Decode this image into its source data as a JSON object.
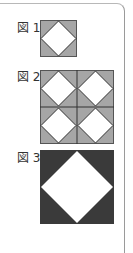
{
  "figures": [
    {
      "label": "図 1",
      "description": "Gray square with inscribed white diamond (vertices at edge midpoints)",
      "grid": "1x1",
      "fill_color": "#a6a6a6",
      "diamond_color": "#ffffff",
      "line_color": "#333333"
    },
    {
      "label": "図 2",
      "description": "2x2 arrangement of figure 1 tiles",
      "grid": "2x2",
      "fill_color": "#a6a6a6",
      "diamond_color": "#ffffff",
      "line_color": "#333333"
    },
    {
      "label": "図 3",
      "description": "Dark square with a large inscribed white diamond",
      "grid": "1x1",
      "fill_color": "#3a3a3a",
      "diamond_color": "#ffffff",
      "line_color": "#3a3a3a"
    }
  ]
}
